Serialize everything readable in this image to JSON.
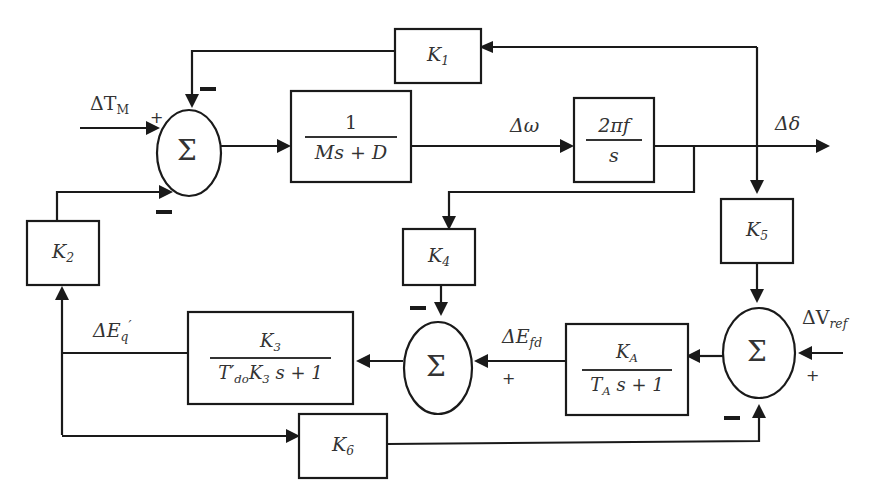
{
  "diagram": {
    "type": "block-diagram",
    "title": "",
    "inputs": {
      "torque": {
        "label": "ΔT",
        "sub": "M"
      },
      "vref": {
        "label": "ΔV",
        "sub": "ref"
      }
    },
    "signals": {
      "omega": "Δω",
      "delta": "Δδ",
      "efd": {
        "label": "ΔE",
        "sub": "fd"
      },
      "eq": {
        "label": "ΔE",
        "sub": "q",
        "sup": "′"
      }
    },
    "blocks": {
      "k1": {
        "label": "K",
        "sub": "1"
      },
      "k2": {
        "label": "K",
        "sub": "2"
      },
      "k4": {
        "label": "K",
        "sub": "4"
      },
      "k5": {
        "label": "K",
        "sub": "5"
      },
      "k6": {
        "label": "K",
        "sub": "6"
      },
      "mech": {
        "num": "1",
        "den": "Ms + D"
      },
      "integrator": {
        "num": "2πf",
        "den": "s"
      },
      "field": {
        "num_k": "K",
        "num_sub": "3",
        "den": "T′",
        "den_sub": "do",
        "den_rest": "K",
        "den_rest_sub": "3",
        "den_tail": "s + 1"
      },
      "exciter": {
        "num_k": "K",
        "num_sub": "A",
        "den": "T",
        "den_sub": "A",
        "den_tail": "s + 1"
      }
    },
    "summers": {
      "symbol": "Σ",
      "sum1": {
        "signs": [
          "+",
          "−",
          "−"
        ]
      },
      "sum2": {
        "signs": [
          "−",
          "+"
        ]
      },
      "sum3": {
        "signs": [
          "+",
          "+",
          "−"
        ]
      }
    },
    "plus": "+"
  }
}
